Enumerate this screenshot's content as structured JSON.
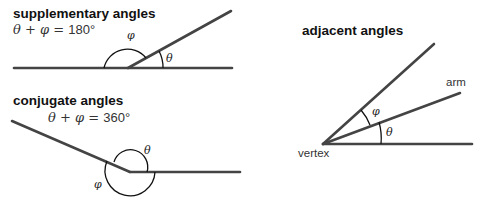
{
  "supplementary": {
    "title": "supplementary angles",
    "equation_lhs": "θ + φ = ",
    "equation_value": "180°",
    "theta": "θ",
    "phi": "φ"
  },
  "conjugate": {
    "title": "conjugate angles",
    "equation_lhs": "θ + φ = ",
    "equation_value": "360°",
    "theta": "θ",
    "phi": "φ"
  },
  "adjacent": {
    "title": "adjacent angles",
    "arm_label": "arm",
    "vertex_label": "vertex",
    "theta": "θ",
    "phi": "φ"
  }
}
